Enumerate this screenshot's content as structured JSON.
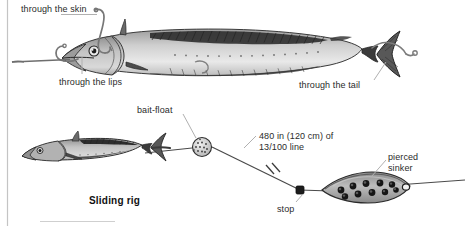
{
  "figure": {
    "title": "Sliding rig",
    "background_color": "#ffffff",
    "ink_color": "#2b2b2b",
    "rule_color": "#c9c9c9",
    "fish_body_color": "#b9b9b9",
    "fish_dark_color": "#2e2e2e",
    "sinker_color": "#9a9a9a"
  },
  "upper_diagram": {
    "name": "baited-fish-hook-placements",
    "labels": [
      {
        "id": "skin",
        "text": "through the skin"
      },
      {
        "id": "lips",
        "text": "through the lips"
      },
      {
        "id": "tail",
        "text": "through the tail"
      }
    ]
  },
  "lower_diagram": {
    "name": "sliding-rig",
    "title": "Sliding rig",
    "labels": [
      {
        "id": "bait-float",
        "text": "bait-float"
      },
      {
        "id": "line-spec-1",
        "text": "480 in (120 cm) of"
      },
      {
        "id": "line-spec-2",
        "text": "13/100 line"
      },
      {
        "id": "stop",
        "text": "stop"
      },
      {
        "id": "sinker-1",
        "text": "pierced"
      },
      {
        "id": "sinker-2",
        "text": "sinker"
      }
    ],
    "components": [
      "bait-fish",
      "bait-float",
      "main-line",
      "stop",
      "pierced-sinker"
    ]
  }
}
